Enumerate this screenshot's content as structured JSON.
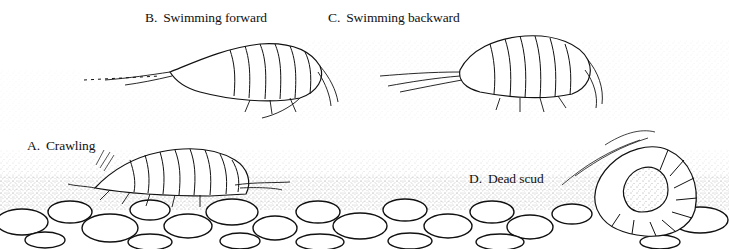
{
  "figure": {
    "type": "scientific-illustration",
    "labels": [
      {
        "id": "A",
        "letter": "A.",
        "text": "Crawling"
      },
      {
        "id": "B",
        "letter": "B.",
        "text": "Swimming forward"
      },
      {
        "id": "C",
        "letter": "C.",
        "text": "Swimming backward"
      },
      {
        "id": "D",
        "letter": "D.",
        "text": "Dead scud"
      }
    ]
  },
  "colors": {
    "ink": "#111111",
    "paper": "#ffffff",
    "stipple": "#555555"
  }
}
